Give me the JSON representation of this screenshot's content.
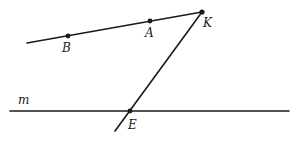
{
  "diagram": {
    "type": "geometry",
    "points": [
      {
        "id": "B",
        "label": "B",
        "x": 68,
        "y": 36,
        "label_x": 62,
        "label_y": 52
      },
      {
        "id": "A",
        "label": "A",
        "x": 150,
        "y": 21,
        "label_x": 145,
        "label_y": 37
      },
      {
        "id": "K",
        "label": "K",
        "x": 202,
        "y": 12,
        "label_x": 203,
        "label_y": 27
      },
      {
        "id": "E",
        "label": "E",
        "x": 130,
        "y": 111,
        "label_x": 128,
        "label_y": 129
      }
    ],
    "lines": [
      {
        "id": "line-BK",
        "x1": 27,
        "y1": 43,
        "x2": 202,
        "y2": 12
      },
      {
        "id": "line-m",
        "label": "m",
        "x1": 10,
        "y1": 111,
        "x2": 289,
        "y2": 111,
        "label_x": 18,
        "label_y": 104
      },
      {
        "id": "line-KE",
        "x1": 202,
        "y1": 12,
        "x2": 115,
        "y2": 131
      }
    ],
    "colors": {
      "stroke": "#1a1a1a",
      "background": "#ffffff"
    }
  }
}
